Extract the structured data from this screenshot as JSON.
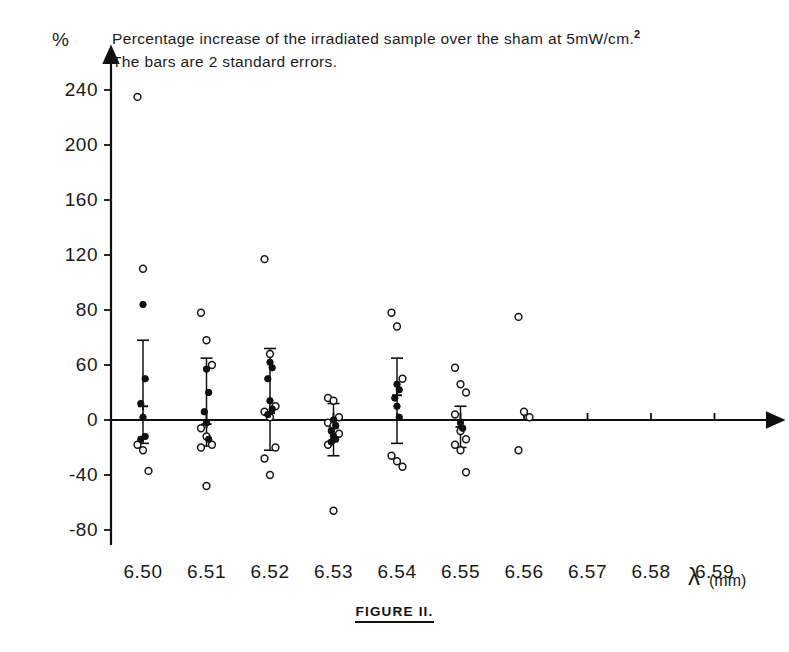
{
  "figure": {
    "title_line1": "Percentage increase of the irradiated  sample over the sham at 5mW/cm.",
    "title_sup": "2",
    "title_line2": "The bars are 2 standard errors.",
    "caption": "FIGURE II.",
    "y_axis_symbol": "%",
    "x_axis_symbol": "λ",
    "x_axis_unit": "(mm)"
  },
  "chart_data": {
    "type": "scatter",
    "title": "Percentage increase of the irradiated sample over the sham at 5mW/cm.2 The bars are 2 standard errors.",
    "subtitle": "The bars are 2 standard errors.",
    "xlabel": "λ (mm)",
    "ylabel": "%",
    "grid": false,
    "legend": "none",
    "xlim": [
      6.495,
      6.605
    ],
    "ylim": [
      -95,
      255
    ],
    "x_tick_labels": [
      "6.50",
      "6.51",
      "6.52",
      "6.53",
      "6.54",
      "6.55",
      "6.56",
      "6.57",
      "6.58",
      "6.59"
    ],
    "x_tick_values": [
      6.5,
      6.51,
      6.52,
      6.53,
      6.54,
      6.55,
      6.56,
      6.57,
      6.58,
      6.59
    ],
    "y_tick_labels": [
      "240",
      "200",
      "160",
      "120",
      "80",
      "60",
      "0",
      "-40",
      "-80"
    ],
    "y_tick_values": [
      240,
      200,
      160,
      120,
      80,
      40,
      0,
      -40,
      -80
    ],
    "error_bar_description": "Bars are 2 standard errors about the group mean",
    "marker_legend": {
      "open_circle": "individual observation",
      "filled_circle": "individual observation (filled)",
      "cross_mean": "group mean"
    },
    "series": [
      {
        "name": "6.50",
        "x": 6.5,
        "mean": 10,
        "err_low": -17,
        "err_high": 58,
        "open_points": [
          235,
          110,
          -37,
          -18,
          -22
        ],
        "filled_points": [
          84,
          30,
          12,
          2,
          -12,
          -14
        ]
      },
      {
        "name": "6.51",
        "x": 6.51,
        "mean": -3,
        "err_low": -19,
        "err_high": 45,
        "open_points": [
          78,
          58,
          40,
          -6,
          -12,
          -18,
          -20,
          -48
        ],
        "filled_points": [
          37,
          20,
          6,
          -2,
          -14
        ]
      },
      {
        "name": "6.52",
        "x": 6.52,
        "mean": 5,
        "err_low": -22,
        "err_high": 52,
        "open_points": [
          117,
          48,
          10,
          6,
          2,
          -20,
          -28,
          -40
        ],
        "filled_points": [
          42,
          38,
          30,
          14,
          8,
          4
        ]
      },
      {
        "name": "6.53",
        "x": 6.53,
        "mean": -6,
        "err_low": -26,
        "err_high": 12,
        "open_points": [
          16,
          14,
          2,
          -2,
          -4,
          -10,
          -18,
          -66
        ],
        "filled_points": [
          0,
          -4,
          -8,
          -12,
          -14,
          -16
        ]
      },
      {
        "name": "6.54",
        "x": 6.54,
        "mean": 18,
        "err_low": -17,
        "err_high": 45,
        "open_points": [
          78,
          68,
          30,
          -26,
          -30,
          -34
        ],
        "filled_points": [
          26,
          22,
          16,
          10,
          2
        ]
      },
      {
        "name": "6.55",
        "x": 6.55,
        "mean": -5,
        "err_low": -20,
        "err_high": 10,
        "open_points": [
          38,
          26,
          20,
          4,
          -8,
          -14,
          -18,
          -22,
          -38
        ],
        "filled_points": [
          -2,
          -6
        ]
      },
      {
        "name": "6.56",
        "x": 6.56,
        "mean": null,
        "err_low": null,
        "err_high": null,
        "open_points": [
          75,
          6,
          2,
          -22
        ],
        "filled_points": []
      }
    ]
  }
}
